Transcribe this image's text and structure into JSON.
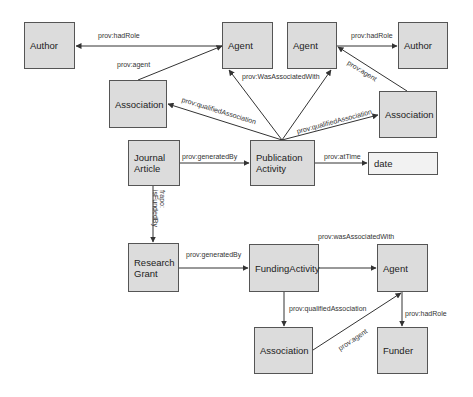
{
  "nodes": {
    "author_left": "Author",
    "agent_top1": "Agent",
    "agent_top2": "Agent",
    "author_right": "Author",
    "association_left": "Association",
    "association_right": "Association",
    "journal_article": "Journal\nArticle",
    "publication_activity": "Publication\nActivity",
    "date": "date",
    "research_grant": "Research\nGrant",
    "funding_activity": "FundingActivity",
    "agent_bottom": "Agent",
    "association_bottom": "Association",
    "funder": "Funder"
  },
  "edges": {
    "had_role_left": "prov:hadRole",
    "agent_left": "prov:agent",
    "qualified_assoc_left": "prov:qualifiedAssociation",
    "was_associated_with_top": "prov:WasAssociatedWith",
    "had_role_right": "prov:hadRole",
    "agent_right": "prov:agent",
    "qualified_assoc_right": "prov:qualifiedAssociation",
    "generated_by_top": "prov:generatedBy",
    "at_time": "prov:atTime",
    "is_funded_by": "frapo:\nisFundedBy",
    "generated_by_bottom": "prov:generatedBy",
    "was_associated_with_bottom": "prov:wasAssociatedWith",
    "qualified_assoc_bottom": "prov:qualifiedAssociation",
    "agent_bottom": "prov:agent",
    "had_role_bottom": "prov:hadRole"
  },
  "colors": {
    "node_fill": "#dcdcdc",
    "node_border": "#555555",
    "edge": "#333333",
    "date_fill": "#f2f2f2"
  }
}
